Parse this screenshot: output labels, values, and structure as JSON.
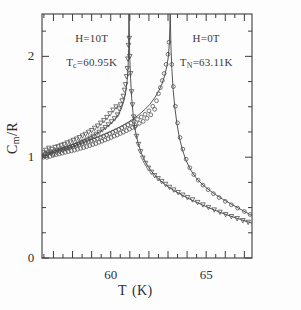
{
  "chart_data": {
    "type": "scatter",
    "title": "",
    "subtitle": "",
    "xlabel": "T",
    "xunit": "(K)",
    "ylabel": "C_m/R",
    "ylabel_parts": {
      "main": "C",
      "sub": "m",
      "denom": "/R"
    },
    "xlim": [
      56.4,
      67.4
    ],
    "ylim": [
      0,
      2.42
    ],
    "xticks_major": [
      60,
      65
    ],
    "xticks_major_labels": [
      "60",
      "65"
    ],
    "xticks_minor_step": 0.5,
    "yticks_major": [
      0,
      1,
      2
    ],
    "yticks_major_labels": [
      "0",
      "1",
      "2"
    ],
    "yticks_minor_step": 0.25,
    "grid": false,
    "legend_position": "none",
    "frame": true,
    "annotations": [
      {
        "id": "field-left",
        "text": "H=10T",
        "x": 59.0,
        "y": 2.18
      },
      {
        "id": "tc-left",
        "text": "T_c=60.95K",
        "x": 59.0,
        "y": 1.93
      },
      {
        "id": "field-right",
        "text": "H=0T",
        "x": 65.0,
        "y": 2.18
      },
      {
        "id": "tn-right",
        "text": "T_N=63.11K",
        "x": 65.0,
        "y": 1.93
      }
    ],
    "annotation_text": {
      "field_left": "H=10T",
      "tc_label": "T",
      "tc_sub": "c",
      "tc_value": "=60.95K",
      "field_right": "H=0T",
      "tn_label": "T",
      "tn_sub": "N",
      "tn_value": "=63.11K"
    },
    "series": [
      {
        "name": "H=10T",
        "marker": "open-triangle-down",
        "transition_temperature": 60.95,
        "color": "#4a4a4a",
        "fit_points": [
          [
            56.4,
            1.01
          ],
          [
            56.7,
            1.035
          ],
          [
            57.0,
            1.058
          ],
          [
            57.3,
            1.078
          ],
          [
            57.6,
            1.098
          ],
          [
            57.9,
            1.118
          ],
          [
            58.2,
            1.14
          ],
          [
            58.5,
            1.163
          ],
          [
            58.8,
            1.188
          ],
          [
            59.1,
            1.216
          ],
          [
            59.4,
            1.248
          ],
          [
            59.7,
            1.286
          ],
          [
            60.0,
            1.332
          ],
          [
            60.2,
            1.372
          ],
          [
            60.4,
            1.424
          ],
          [
            60.55,
            1.478
          ],
          [
            60.68,
            1.552
          ],
          [
            60.78,
            1.638
          ],
          [
            60.86,
            1.76
          ],
          [
            60.91,
            1.9
          ],
          [
            60.94,
            2.08
          ],
          [
            60.95,
            2.42
          ],
          [
            60.96,
            2.42
          ],
          [
            60.99,
            2.02
          ],
          [
            61.04,
            1.78
          ],
          [
            61.1,
            1.58
          ],
          [
            61.18,
            1.41
          ],
          [
            61.28,
            1.27
          ],
          [
            61.42,
            1.15
          ],
          [
            61.6,
            1.04
          ],
          [
            61.85,
            0.94
          ],
          [
            62.15,
            0.855
          ],
          [
            62.5,
            0.785
          ],
          [
            62.9,
            0.72
          ],
          [
            63.35,
            0.665
          ],
          [
            63.85,
            0.612
          ],
          [
            64.4,
            0.56
          ],
          [
            65.0,
            0.51
          ],
          [
            65.6,
            0.462
          ],
          [
            66.2,
            0.42
          ],
          [
            66.8,
            0.382
          ],
          [
            67.4,
            0.345
          ]
        ],
        "scatter_points": [
          [
            56.45,
            1.045
          ],
          [
            56.52,
            1.012
          ],
          [
            56.6,
            1.07
          ],
          [
            56.68,
            1.028
          ],
          [
            56.76,
            1.09
          ],
          [
            56.84,
            1.04
          ],
          [
            56.92,
            1.078
          ],
          [
            57.0,
            1.03
          ],
          [
            57.08,
            1.098
          ],
          [
            57.16,
            1.048
          ],
          [
            57.24,
            1.105
          ],
          [
            57.32,
            1.058
          ],
          [
            57.4,
            1.118
          ],
          [
            57.48,
            1.068
          ],
          [
            57.56,
            1.128
          ],
          [
            57.64,
            1.082
          ],
          [
            57.72,
            1.142
          ],
          [
            57.8,
            1.092
          ],
          [
            57.88,
            1.152
          ],
          [
            57.96,
            1.105
          ],
          [
            58.04,
            1.168
          ],
          [
            58.12,
            1.118
          ],
          [
            58.2,
            1.18
          ],
          [
            58.28,
            1.13
          ],
          [
            58.36,
            1.195
          ],
          [
            58.44,
            1.145
          ],
          [
            58.52,
            1.212
          ],
          [
            58.6,
            1.158
          ],
          [
            58.68,
            1.228
          ],
          [
            58.76,
            1.172
          ],
          [
            58.84,
            1.248
          ],
          [
            58.92,
            1.19
          ],
          [
            59.0,
            1.265
          ],
          [
            59.08,
            1.208
          ],
          [
            59.16,
            1.288
          ],
          [
            59.24,
            1.228
          ],
          [
            59.32,
            1.31
          ],
          [
            59.4,
            1.248
          ],
          [
            59.48,
            1.338
          ],
          [
            59.56,
            1.272
          ],
          [
            59.64,
            1.365
          ],
          [
            59.72,
            1.295
          ],
          [
            59.8,
            1.395
          ],
          [
            59.88,
            1.322
          ],
          [
            59.96,
            1.432
          ],
          [
            60.04,
            1.352
          ],
          [
            60.12,
            1.468
          ],
          [
            60.2,
            1.382
          ],
          [
            60.28,
            1.5
          ],
          [
            60.36,
            1.42
          ],
          [
            60.44,
            1.48
          ],
          [
            60.52,
            1.52
          ],
          [
            60.6,
            1.56
          ],
          [
            60.66,
            1.605
          ],
          [
            60.72,
            1.665
          ],
          [
            60.78,
            1.72
          ],
          [
            60.83,
            1.8
          ],
          [
            60.87,
            1.88
          ],
          [
            60.9,
            1.975
          ],
          [
            60.93,
            2.11
          ],
          [
            60.97,
            2.18
          ],
          [
            61.0,
            2.0
          ],
          [
            61.04,
            1.83
          ],
          [
            61.09,
            1.65
          ],
          [
            61.14,
            1.52
          ],
          [
            61.2,
            1.4
          ],
          [
            61.27,
            1.295
          ],
          [
            61.35,
            1.208
          ],
          [
            61.45,
            1.128
          ],
          [
            61.56,
            1.055
          ],
          [
            61.68,
            0.992
          ],
          [
            61.82,
            0.94
          ],
          [
            61.97,
            0.892
          ],
          [
            62.13,
            0.852
          ],
          [
            62.3,
            0.818
          ],
          [
            62.48,
            0.788
          ],
          [
            62.67,
            0.76
          ],
          [
            62.87,
            0.732
          ],
          [
            63.08,
            0.702
          ],
          [
            63.3,
            0.676
          ],
          [
            63.53,
            0.65
          ],
          [
            63.77,
            0.625
          ],
          [
            64.02,
            0.6
          ],
          [
            64.28,
            0.578
          ],
          [
            64.55,
            0.552
          ],
          [
            64.83,
            0.528
          ],
          [
            65.12,
            0.502
          ],
          [
            65.42,
            0.478
          ],
          [
            65.72,
            0.455
          ],
          [
            66.02,
            0.432
          ],
          [
            66.32,
            0.412
          ],
          [
            66.62,
            0.392
          ],
          [
            66.92,
            0.372
          ],
          [
            67.2,
            0.355
          ]
        ]
      },
      {
        "name": "H=0T",
        "marker": "open-circle",
        "transition_temperature": 63.11,
        "color": "#4a4a4a",
        "fit_points": [
          [
            56.4,
            1.005
          ],
          [
            56.7,
            1.025
          ],
          [
            57.0,
            1.045
          ],
          [
            57.3,
            1.063
          ],
          [
            57.6,
            1.082
          ],
          [
            57.9,
            1.1
          ],
          [
            58.2,
            1.12
          ],
          [
            58.5,
            1.14
          ],
          [
            58.8,
            1.16
          ],
          [
            59.1,
            1.182
          ],
          [
            59.4,
            1.205
          ],
          [
            59.7,
            1.228
          ],
          [
            60.0,
            1.255
          ],
          [
            60.3,
            1.282
          ],
          [
            60.6,
            1.312
          ],
          [
            60.9,
            1.345
          ],
          [
            61.2,
            1.382
          ],
          [
            61.5,
            1.425
          ],
          [
            61.8,
            1.475
          ],
          [
            62.05,
            1.525
          ],
          [
            62.3,
            1.588
          ],
          [
            62.5,
            1.65
          ],
          [
            62.68,
            1.725
          ],
          [
            62.82,
            1.805
          ],
          [
            62.94,
            1.9
          ],
          [
            63.02,
            2.0
          ],
          [
            63.07,
            2.13
          ],
          [
            63.1,
            2.3
          ],
          [
            63.11,
            2.42
          ],
          [
            63.12,
            2.42
          ],
          [
            63.15,
            2.12
          ],
          [
            63.2,
            1.88
          ],
          [
            63.27,
            1.67
          ],
          [
            63.36,
            1.49
          ],
          [
            63.47,
            1.33
          ],
          [
            63.6,
            1.19
          ],
          [
            63.76,
            1.07
          ],
          [
            63.95,
            0.965
          ],
          [
            64.18,
            0.875
          ],
          [
            64.45,
            0.8
          ],
          [
            64.75,
            0.738
          ],
          [
            65.1,
            0.682
          ],
          [
            65.48,
            0.63
          ],
          [
            65.9,
            0.58
          ],
          [
            66.35,
            0.53
          ],
          [
            66.85,
            0.478
          ],
          [
            67.4,
            0.42
          ]
        ],
        "scatter_points": [
          [
            56.48,
            1.0
          ],
          [
            56.58,
            1.038
          ],
          [
            56.66,
            0.998
          ],
          [
            56.74,
            1.048
          ],
          [
            56.82,
            1.008
          ],
          [
            56.9,
            1.055
          ],
          [
            56.98,
            1.018
          ],
          [
            57.06,
            1.062
          ],
          [
            57.14,
            1.025
          ],
          [
            57.22,
            1.07
          ],
          [
            57.3,
            1.032
          ],
          [
            57.38,
            1.078
          ],
          [
            57.46,
            1.04
          ],
          [
            57.54,
            1.085
          ],
          [
            57.62,
            1.048
          ],
          [
            57.7,
            1.092
          ],
          [
            57.78,
            1.055
          ],
          [
            57.86,
            1.1
          ],
          [
            57.94,
            1.062
          ],
          [
            58.02,
            1.108
          ],
          [
            58.1,
            1.07
          ],
          [
            58.18,
            1.118
          ],
          [
            58.26,
            1.078
          ],
          [
            58.34,
            1.125
          ],
          [
            58.42,
            1.088
          ],
          [
            58.5,
            1.135
          ],
          [
            58.58,
            1.095
          ],
          [
            58.66,
            1.145
          ],
          [
            58.74,
            1.105
          ],
          [
            58.82,
            1.155
          ],
          [
            58.9,
            1.115
          ],
          [
            58.98,
            1.165
          ],
          [
            59.06,
            1.125
          ],
          [
            59.14,
            1.175
          ],
          [
            59.22,
            1.135
          ],
          [
            59.3,
            1.185
          ],
          [
            59.38,
            1.148
          ],
          [
            59.46,
            1.198
          ],
          [
            59.54,
            1.158
          ],
          [
            59.62,
            1.21
          ],
          [
            59.7,
            1.17
          ],
          [
            59.78,
            1.222
          ],
          [
            59.86,
            1.182
          ],
          [
            59.94,
            1.235
          ],
          [
            60.02,
            1.195
          ],
          [
            60.1,
            1.248
          ],
          [
            60.18,
            1.208
          ],
          [
            60.26,
            1.262
          ],
          [
            60.34,
            1.22
          ],
          [
            60.42,
            1.275
          ],
          [
            60.5,
            1.235
          ],
          [
            60.58,
            1.29
          ],
          [
            60.66,
            1.248
          ],
          [
            60.74,
            1.305
          ],
          [
            60.82,
            1.262
          ],
          [
            60.9,
            1.32
          ],
          [
            60.98,
            1.278
          ],
          [
            61.06,
            1.338
          ],
          [
            61.14,
            1.295
          ],
          [
            61.22,
            1.355
          ],
          [
            61.3,
            1.312
          ],
          [
            61.4,
            1.375
          ],
          [
            61.5,
            1.335
          ],
          [
            61.6,
            1.398
          ],
          [
            61.7,
            1.355
          ],
          [
            61.8,
            1.425
          ],
          [
            61.9,
            1.385
          ],
          [
            62.0,
            1.46
          ],
          [
            62.1,
            1.42
          ],
          [
            62.2,
            1.505
          ],
          [
            62.3,
            1.475
          ],
          [
            62.4,
            1.56
          ],
          [
            62.5,
            1.63
          ],
          [
            62.6,
            1.69
          ],
          [
            62.7,
            1.76
          ],
          [
            62.8,
            1.83
          ],
          [
            62.9,
            1.92
          ],
          [
            63.0,
            2.02
          ],
          [
            63.05,
            2.14
          ],
          [
            63.2,
            1.92
          ],
          [
            63.28,
            1.7
          ],
          [
            63.38,
            1.505
          ],
          [
            63.5,
            1.34
          ],
          [
            63.63,
            1.195
          ],
          [
            63.78,
            1.08
          ],
          [
            63.95,
            0.98
          ],
          [
            64.14,
            0.895
          ],
          [
            64.35,
            0.828
          ],
          [
            64.58,
            0.772
          ],
          [
            64.83,
            0.722
          ],
          [
            65.1,
            0.678
          ],
          [
            65.38,
            0.638
          ],
          [
            65.68,
            0.6
          ],
          [
            66.0,
            0.562
          ],
          [
            66.32,
            0.528
          ],
          [
            66.65,
            0.495
          ],
          [
            67.0,
            0.462
          ],
          [
            67.3,
            0.432
          ]
        ]
      }
    ]
  }
}
